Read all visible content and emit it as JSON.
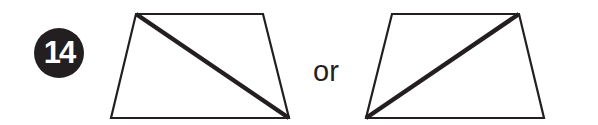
{
  "problem": {
    "number": "14",
    "badge_color": "#231f20",
    "badge_text_color": "#ffffff"
  },
  "connector_text": "or",
  "figures": [
    {
      "name": "trapezoid-left",
      "shape": "trapezoid",
      "vertices": [
        [
          136,
          14
        ],
        [
          263,
          14
        ],
        [
          289,
          118
        ],
        [
          111,
          118
        ]
      ],
      "diagonal": {
        "from": [
          136,
          14
        ],
        "to": [
          289,
          118
        ],
        "description": "top-left to bottom-right"
      }
    },
    {
      "name": "trapezoid-right",
      "shape": "trapezoid",
      "vertices": [
        [
          392,
          14
        ],
        [
          519,
          14
        ],
        [
          544,
          118
        ],
        [
          366,
          118
        ]
      ],
      "diagonal": {
        "from": [
          366,
          118
        ],
        "to": [
          519,
          14
        ],
        "description": "bottom-left to top-right"
      }
    }
  ],
  "colors": {
    "stroke": "#231f20",
    "background": "#ffffff"
  }
}
